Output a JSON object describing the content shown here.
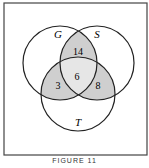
{
  "figure": {
    "caption": "FIGURE 11",
    "circles": [
      {
        "label": "G",
        "cx": 60,
        "cy": 63,
        "r": 37
      },
      {
        "label": "S",
        "cx": 97,
        "cy": 63,
        "r": 37
      },
      {
        "label": "T",
        "cx": 78,
        "cy": 94,
        "r": 37
      }
    ],
    "regions": {
      "G_and_S_only": "14",
      "G_and_T_only": "3",
      "S_and_T_only": "8",
      "G_S_T": "6"
    },
    "colors": {
      "shade": "#cfcfcf",
      "center": "#e6e6e6",
      "stroke": "#222222"
    }
  }
}
